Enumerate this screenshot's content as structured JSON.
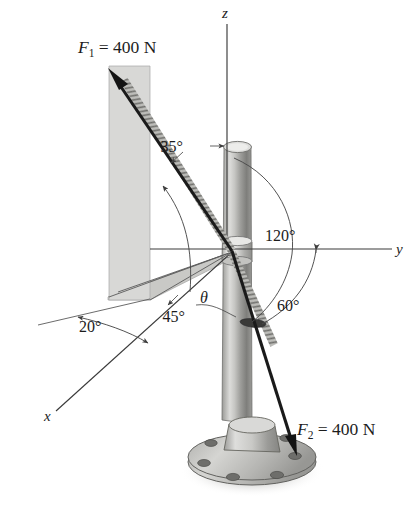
{
  "figure": {
    "kind": "engineering-statics-free-body-diagram",
    "axes": [
      {
        "name": "z-axis",
        "label": "z"
      },
      {
        "name": "y-axis",
        "label": "y"
      },
      {
        "name": "x-axis",
        "label": "x"
      }
    ],
    "forces": [
      {
        "name": "force-f1",
        "symbol": "F",
        "subscript": "1",
        "equals": "=",
        "magnitude": "400",
        "unit": "N",
        "label": "F₁ = 400 N"
      },
      {
        "name": "force-f2",
        "symbol": "F",
        "subscript": "2",
        "equals": "=",
        "magnitude": "400",
        "unit": "N",
        "label": "F₂ = 400 N"
      }
    ],
    "angles": [
      {
        "name": "angle-35",
        "label": "35°",
        "value": 35
      },
      {
        "name": "angle-120",
        "label": "120°",
        "value": 120
      },
      {
        "name": "angle-60",
        "label": "60°",
        "value": 60
      },
      {
        "name": "angle-20",
        "label": "20°",
        "value": 20
      },
      {
        "name": "angle-45",
        "label": "45°",
        "value": 45
      },
      {
        "name": "angle-theta",
        "label": "θ",
        "value": null
      }
    ],
    "colors": {
      "ink": "#1c1c1c",
      "force_stroke": "#1a1a1a",
      "axis_stroke": "#3a3a3a",
      "plane_vertical_fill": "#d8d8d6",
      "plane_horizontal_fill": "#c2c2bf",
      "pole_light": "#e6e6e4",
      "pole_mid": "#a5a5a2",
      "pole_dark": "#6e6e6b",
      "flange_fill": "#b9b9b6",
      "shadow": "#cfcfcc"
    },
    "parts": [
      {
        "name": "pole",
        "label": "vertical pole"
      },
      {
        "name": "collar",
        "label": "collar at origin"
      },
      {
        "name": "base-flange",
        "label": "bolted base flange"
      },
      {
        "name": "cable-f1",
        "label": "upper cable"
      },
      {
        "name": "cable-f2",
        "label": "lower cable"
      }
    ]
  }
}
